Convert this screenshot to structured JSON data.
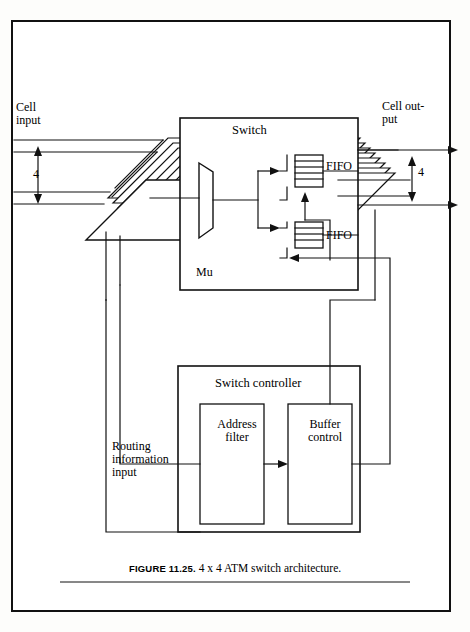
{
  "figure": {
    "caption_label": "FIGURE 11.25.",
    "caption_text": "4 x 4 ATM switch architecture.",
    "labels": {
      "cell_input": "Cell\ninput",
      "cell_output": "Cell out-\nput",
      "input_count": "4",
      "output_count": "4",
      "switch": "Switch",
      "mux": "Mu",
      "fifo_top": "FIFO",
      "fifo_bottom": "FIFO",
      "switch_controller": "Switch controller",
      "address_filter": "Address\nfilter",
      "buffer_control": "Buffer\ncontrol",
      "routing_input": "Routing\ninformation\ninput"
    },
    "colors": {
      "line": "#111111",
      "page_bg": "#ffffff",
      "border": "#111111"
    },
    "counts": {
      "stacked_planes": 8,
      "input_lines": 4,
      "output_lines": 4
    }
  }
}
